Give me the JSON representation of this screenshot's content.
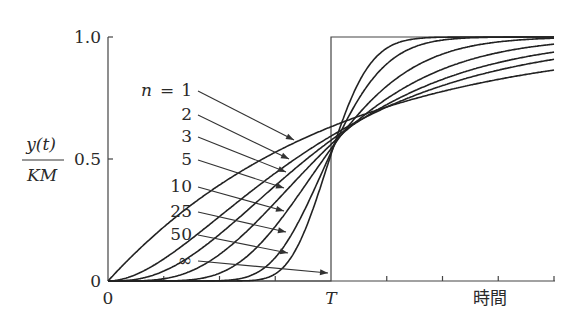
{
  "chart_data": {
    "type": "line",
    "title": "",
    "xlabel": "時間",
    "ylabel_numerator": "y(t)",
    "ylabel_denominator": "KM",
    "x_tick_labels": [
      {
        "value": 0,
        "label": "0"
      },
      {
        "value": 1,
        "label": "T"
      }
    ],
    "y_tick_labels": [
      {
        "value": 0,
        "label": "0"
      },
      {
        "value": 0.5,
        "label": "0.5"
      },
      {
        "value": 1.0,
        "label": "1.0"
      }
    ],
    "xlim": [
      0,
      2
    ],
    "ylim": [
      0,
      1
    ],
    "x_unit": "T",
    "minor_ticks_x": [
      0.25,
      0.5,
      0.75,
      1.25,
      1.5,
      1.75,
      2.0
    ],
    "grid": false,
    "legend_position": "inline-arrows",
    "series": [
      {
        "name": "n = 1",
        "n": 1,
        "label": "1",
        "y_at_T": 0.632,
        "y_at_2T": 0.865
      },
      {
        "name": "n = 2",
        "n": 2,
        "label": "2",
        "y_at_T": 0.594,
        "y_at_2T": 0.908
      },
      {
        "name": "n = 3",
        "n": 3,
        "label": "3",
        "y_at_T": 0.577,
        "y_at_2T": 0.938
      },
      {
        "name": "n = 5",
        "n": 5,
        "label": "5",
        "y_at_T": 0.56,
        "y_at_2T": 0.971
      },
      {
        "name": "n = 10",
        "n": 10,
        "label": "10",
        "y_at_T": 0.542,
        "y_at_2T": 0.997
      },
      {
        "name": "n = 25",
        "n": 25,
        "label": "25",
        "y_at_T": 0.527,
        "y_at_2T": 1.0
      },
      {
        "name": "n = 50",
        "n": 50,
        "label": "50",
        "y_at_T": 0.519,
        "y_at_2T": 1.0
      },
      {
        "name": "n = ∞",
        "n": "inf",
        "label": "∞",
        "step_at": 1.0
      }
    ],
    "formula": "y(t)/KM = 1 - Σ_{k=0}^{n-1} e^{-nt/T} (nt/T)^k / k!"
  },
  "labels": {
    "n_prefix": "n",
    "equals": "=",
    "series_labels": [
      "1",
      "2",
      "3",
      "5",
      "10",
      "25",
      "50",
      "∞"
    ],
    "x_origin": "0",
    "x_T": "T",
    "x_axis_title": "時間",
    "y_0": "0",
    "y_05": "0.5",
    "y_10": "1.0",
    "y_axis_num": "y(t)",
    "y_axis_den": "KM"
  }
}
